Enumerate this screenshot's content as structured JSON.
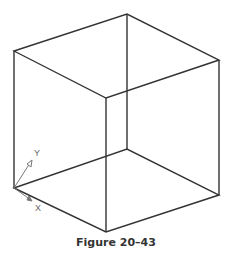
{
  "figure": {
    "caption": "Figure 20–43",
    "edge_color": "#333333",
    "ucs_icon": {
      "x_label": "X",
      "y_label": "Y",
      "color": "#777777"
    }
  }
}
